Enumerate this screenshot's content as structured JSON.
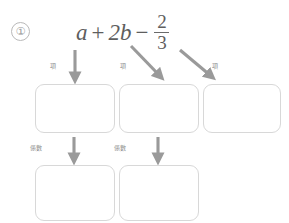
{
  "worksheet": {
    "problem_number": "①",
    "expression": {
      "term_1": "a",
      "operator_1": "+",
      "term_2": "2b",
      "operator_2": "−",
      "fraction_numerator": "2",
      "fraction_denominator": "3"
    },
    "labels": {
      "term": "項",
      "coefficient": "係數"
    },
    "arrow_labels": [
      {
        "id": "term-1",
        "text": "項"
      },
      {
        "id": "term-2",
        "text": "項"
      },
      {
        "id": "term-3",
        "text": "項"
      },
      {
        "id": "coef-1",
        "text": "係數"
      },
      {
        "id": "coef-2",
        "text": "係數"
      }
    ],
    "answer_boxes": {
      "term_row": [
        {
          "id": "term-1",
          "value": ""
        },
        {
          "id": "term-2",
          "value": ""
        },
        {
          "id": "term-3",
          "value": ""
        }
      ],
      "coefficient_row": [
        {
          "id": "coef-1",
          "value": ""
        },
        {
          "id": "coef-2",
          "value": ""
        }
      ]
    },
    "colors": {
      "text": "#5e5e5e",
      "box_border": "#d8d8d8",
      "arrow": "#9a9a9a",
      "label": "#8d8d8d",
      "background": "#ffffff"
    }
  }
}
